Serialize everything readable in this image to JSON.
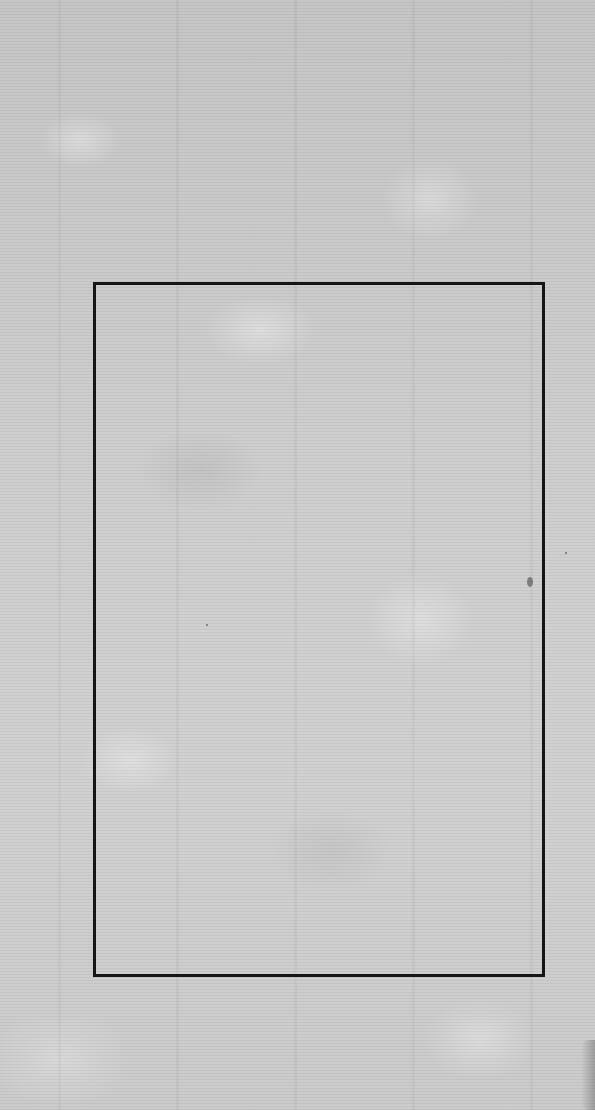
{
  "page": {
    "type": "blank scanned leaf",
    "background_color": "#c9c9c9",
    "frame": {
      "color": "#151515",
      "left": 93,
      "top": 282,
      "right": 545,
      "bottom": 977,
      "thickness": 3
    },
    "text": ""
  }
}
